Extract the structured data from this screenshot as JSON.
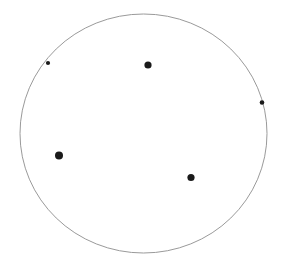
{
  "figure": {
    "title": "",
    "width": 282,
    "height": 272,
    "background_color": "#ffffff"
  },
  "chart_data": {
    "type": "scatter",
    "title": "",
    "subtitle": "",
    "xlabel": "",
    "ylabel": "",
    "xlim": [
      0,
      282
    ],
    "ylim": [
      0,
      272
    ],
    "grid": false,
    "legend": null,
    "axes_visible": false,
    "tick_labels_x": [],
    "tick_labels_y": [],
    "annotations": [],
    "boundary": {
      "shape": "circle",
      "label": "unit-circle-boundary",
      "center_x": 143.5,
      "center_y": 133.5,
      "radius_x": 123.5,
      "radius_y": 119.5,
      "stroke_color": "#9a9a9a",
      "stroke_width": 1,
      "fill": "none"
    },
    "marker_color": "#1a1a1a",
    "series": [
      {
        "name": "interior-points",
        "marker": "filled-circle",
        "color": "#1a1a1a",
        "points": [
          {
            "label": "point-top-center",
            "x": 148,
            "y": 65,
            "r": 3.6
          },
          {
            "label": "point-left-lower",
            "x": 59,
            "y": 155.5,
            "r": 4.0
          },
          {
            "label": "point-bottom-center",
            "x": 191,
            "y": 177.5,
            "r": 3.6
          }
        ]
      },
      {
        "name": "boundary-points",
        "marker": "filled-circle",
        "color": "#1a1a1a",
        "points": [
          {
            "label": "point-on-boundary-upper-left",
            "x": 48,
            "y": 63,
            "r": 2.1
          },
          {
            "label": "point-on-boundary-right",
            "x": 262,
            "y": 102.5,
            "r": 2.3
          }
        ]
      }
    ]
  }
}
